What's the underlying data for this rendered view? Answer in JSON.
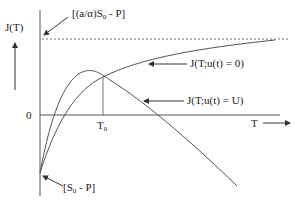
{
  "diagram": {
    "y_axis_label": "J(T)",
    "x_axis_label": "T",
    "origin_label": "0",
    "asymptote_label_pre": "[(a/α)S",
    "asymptote_label_sub": "0",
    "asymptote_label_post": " - P]",
    "intercept_label_pre": "[S",
    "intercept_label_sub": "0",
    "intercept_label_post": " - P]",
    "t0_label_pre": "T",
    "t0_label_sub": "0",
    "curve_u0_label": "J(T;u(t) = 0)",
    "curve_uU_label": "J(T;u(t) = U)",
    "line_color": "#555555"
  }
}
